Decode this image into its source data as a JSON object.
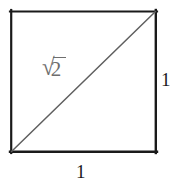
{
  "figure": {
    "background_color": "#ffffff",
    "square": {
      "stroke_color": "#1a1a1a",
      "stroke_width": 2,
      "left": 11,
      "top": 11,
      "right": 156,
      "bottom": 152
    },
    "diagonal": {
      "stroke_color": "#5f5f5f",
      "stroke_width": 1.5,
      "from": "bottom-left",
      "to": "top-right"
    },
    "labels": {
      "diagonal_label": {
        "radical_sign": "√",
        "radicand": "2",
        "full_text": "√2",
        "color": "#6e6e6e"
      },
      "right_side_label": {
        "text": "1",
        "color": "#1c1c1c"
      },
      "bottom_side_label": {
        "text": "1",
        "color": "#1c1c1c"
      }
    }
  }
}
